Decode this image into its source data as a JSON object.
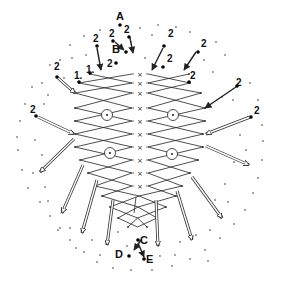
{
  "labels": {
    "A": {
      "text": "A",
      "x": 116,
      "y": 20
    },
    "B": {
      "text": "B",
      "x": 112,
      "y": 53
    },
    "C": {
      "text": "C",
      "x": 140,
      "y": 244
    },
    "D": {
      "text": "D",
      "x": 115,
      "y": 258
    },
    "E": {
      "text": "E",
      "x": 146,
      "y": 263
    }
  },
  "numbers": [
    {
      "text": "2",
      "x": 93,
      "y": 42
    },
    {
      "text": "2",
      "x": 109,
      "y": 37
    },
    {
      "text": "2",
      "x": 124,
      "y": 33
    },
    {
      "text": "2",
      "x": 107,
      "y": 67
    },
    {
      "text": "2",
      "x": 168,
      "y": 37
    },
    {
      "text": "2",
      "x": 201,
      "y": 47
    },
    {
      "text": "2",
      "x": 167,
      "y": 62
    },
    {
      "text": "2",
      "x": 190,
      "y": 79
    },
    {
      "text": "2",
      "x": 236,
      "y": 86
    },
    {
      "text": "2",
      "x": 254,
      "y": 114
    },
    {
      "text": "2",
      "x": 54,
      "y": 70
    },
    {
      "text": "2",
      "x": 30,
      "y": 113
    },
    {
      "text": "1.",
      "x": 86,
      "y": 73
    },
    {
      "text": "1.",
      "x": 74,
      "y": 79
    }
  ],
  "symbols": {
    "row_marker": "×",
    "circle_marker": "⊙"
  },
  "zigzag_rows": [
    {
      "y": 74,
      "lx": 90,
      "rx": 189,
      "x_marker": true
    },
    {
      "y": 83,
      "lx": 79,
      "rx": 190,
      "x_marker": true
    },
    {
      "y": 93,
      "lx": 75,
      "rx": 201,
      "x_marker": true
    },
    {
      "y": 108,
      "lx": 75,
      "rx": 205,
      "x_marker": true
    },
    {
      "y": 121,
      "lx": 75,
      "rx": 205,
      "x_marker": true
    },
    {
      "y": 134,
      "lx": 75,
      "rx": 203,
      "x_marker": true
    },
    {
      "y": 147,
      "lx": 75,
      "rx": 203,
      "x_marker": true
    },
    {
      "y": 160,
      "lx": 80,
      "rx": 198,
      "x_marker": true
    },
    {
      "y": 173,
      "lx": 88,
      "rx": 190,
      "x_marker": true
    },
    {
      "y": 186,
      "lx": 95,
      "rx": 182,
      "x_marker": true
    },
    {
      "y": 196,
      "lx": 102,
      "rx": 176,
      "x_marker": false
    },
    {
      "y": 207,
      "lx": 110,
      "rx": 166,
      "x_marker": false
    },
    {
      "y": 218,
      "lx": 118,
      "rx": 157,
      "x_marker": false
    },
    {
      "y": 227,
      "lx": 128,
      "rx": 147,
      "x_marker": false
    }
  ],
  "circles": [
    {
      "x": 107,
      "y": 115
    },
    {
      "x": 173,
      "y": 115
    },
    {
      "x": 110,
      "y": 153
    },
    {
      "x": 172,
      "y": 154
    }
  ],
  "arrows_solid": [
    {
      "x1": 97,
      "y1": 48,
      "x2": 101,
      "y2": 70
    },
    {
      "x1": 115,
      "y1": 42,
      "x2": 124,
      "y2": 50
    },
    {
      "x1": 130,
      "y1": 38,
      "x2": 133,
      "y2": 53
    },
    {
      "x1": 163,
      "y1": 48,
      "x2": 152,
      "y2": 70
    },
    {
      "x1": 196,
      "y1": 52,
      "x2": 184,
      "y2": 70
    },
    {
      "x1": 236,
      "y1": 87,
      "x2": 205,
      "y2": 108
    },
    {
      "x1": 141,
      "y1": 240,
      "x2": 134,
      "y2": 250
    },
    {
      "x1": 138,
      "y1": 243,
      "x2": 144,
      "y2": 257
    }
  ],
  "arrows_hollow": [
    {
      "x1": 58,
      "y1": 78,
      "x2": 75,
      "y2": 93
    },
    {
      "x1": 38,
      "y1": 117,
      "x2": 74,
      "y2": 134
    },
    {
      "x1": 250,
      "y1": 117,
      "x2": 206,
      "y2": 134
    },
    {
      "x1": 206,
      "y1": 146,
      "x2": 249,
      "y2": 165
    },
    {
      "x1": 74,
      "y1": 139,
      "x2": 40,
      "y2": 172
    },
    {
      "x1": 83,
      "y1": 165,
      "x2": 62,
      "y2": 213
    },
    {
      "x1": 97,
      "y1": 180,
      "x2": 82,
      "y2": 233
    },
    {
      "x1": 113,
      "y1": 200,
      "x2": 107,
      "y2": 245
    },
    {
      "x1": 156,
      "y1": 200,
      "x2": 158,
      "y2": 246
    },
    {
      "x1": 177,
      "y1": 191,
      "x2": 192,
      "y2": 240
    },
    {
      "x1": 192,
      "y1": 177,
      "x2": 222,
      "y2": 218
    }
  ],
  "big_dots": [
    {
      "x": 120,
      "y": 25
    },
    {
      "x": 97,
      "y": 46
    },
    {
      "x": 113,
      "y": 41
    },
    {
      "x": 129,
      "y": 37
    },
    {
      "x": 126,
      "y": 52
    },
    {
      "x": 116,
      "y": 63
    },
    {
      "x": 90,
      "y": 73
    },
    {
      "x": 79,
      "y": 82
    },
    {
      "x": 164,
      "y": 46
    },
    {
      "x": 198,
      "y": 52
    },
    {
      "x": 163,
      "y": 67
    },
    {
      "x": 189,
      "y": 82
    },
    {
      "x": 237,
      "y": 86
    },
    {
      "x": 251,
      "y": 117
    },
    {
      "x": 57,
      "y": 77
    },
    {
      "x": 36,
      "y": 116
    },
    {
      "x": 138,
      "y": 240
    },
    {
      "x": 129,
      "y": 256
    },
    {
      "x": 144,
      "y": 259
    }
  ],
  "small_dots": [
    {
      "x": 140,
      "y": 28
    },
    {
      "x": 158,
      "y": 25
    },
    {
      "x": 176,
      "y": 27
    },
    {
      "x": 190,
      "y": 32
    },
    {
      "x": 100,
      "y": 30
    },
    {
      "x": 84,
      "y": 36
    },
    {
      "x": 70,
      "y": 45
    },
    {
      "x": 86,
      "y": 55
    },
    {
      "x": 72,
      "y": 58
    },
    {
      "x": 60,
      "y": 60
    },
    {
      "x": 50,
      "y": 65
    },
    {
      "x": 42,
      "y": 83
    },
    {
      "x": 32,
      "y": 87
    },
    {
      "x": 25,
      "y": 104
    },
    {
      "x": 20,
      "y": 121
    },
    {
      "x": 17,
      "y": 137
    },
    {
      "x": 18,
      "y": 150
    },
    {
      "x": 22,
      "y": 170
    },
    {
      "x": 28,
      "y": 188
    },
    {
      "x": 40,
      "y": 202
    },
    {
      "x": 50,
      "y": 216
    },
    {
      "x": 60,
      "y": 228
    },
    {
      "x": 70,
      "y": 240
    },
    {
      "x": 84,
      "y": 252
    },
    {
      "x": 97,
      "y": 262
    },
    {
      "x": 113,
      "y": 268
    },
    {
      "x": 131,
      "y": 270
    },
    {
      "x": 152,
      "y": 270
    },
    {
      "x": 172,
      "y": 266
    },
    {
      "x": 190,
      "y": 259
    },
    {
      "x": 205,
      "y": 250
    },
    {
      "x": 220,
      "y": 238
    },
    {
      "x": 234,
      "y": 224
    },
    {
      "x": 245,
      "y": 210
    },
    {
      "x": 253,
      "y": 193
    },
    {
      "x": 258,
      "y": 178
    },
    {
      "x": 262,
      "y": 160
    },
    {
      "x": 263,
      "y": 141
    },
    {
      "x": 262,
      "y": 125
    },
    {
      "x": 258,
      "y": 100
    },
    {
      "x": 250,
      "y": 83
    },
    {
      "x": 225,
      "y": 55
    },
    {
      "x": 216,
      "y": 42
    },
    {
      "x": 204,
      "y": 60
    },
    {
      "x": 213,
      "y": 72
    },
    {
      "x": 222,
      "y": 97
    },
    {
      "x": 233,
      "y": 100
    },
    {
      "x": 240,
      "y": 135
    },
    {
      "x": 246,
      "y": 150
    },
    {
      "x": 234,
      "y": 162
    },
    {
      "x": 225,
      "y": 184
    },
    {
      "x": 215,
      "y": 200
    },
    {
      "x": 228,
      "y": 202
    },
    {
      "x": 210,
      "y": 230
    },
    {
      "x": 196,
      "y": 235
    },
    {
      "x": 44,
      "y": 104
    },
    {
      "x": 35,
      "y": 140
    },
    {
      "x": 42,
      "y": 155
    },
    {
      "x": 33,
      "y": 173
    },
    {
      "x": 45,
      "y": 187
    },
    {
      "x": 48,
      "y": 201
    },
    {
      "x": 58,
      "y": 230
    },
    {
      "x": 70,
      "y": 228
    },
    {
      "x": 76,
      "y": 248
    },
    {
      "x": 92,
      "y": 240
    },
    {
      "x": 100,
      "y": 255
    },
    {
      "x": 118,
      "y": 232
    },
    {
      "x": 127,
      "y": 246
    },
    {
      "x": 160,
      "y": 256
    },
    {
      "x": 175,
      "y": 255
    },
    {
      "x": 180,
      "y": 242
    },
    {
      "x": 208,
      "y": 261
    },
    {
      "x": 64,
      "y": 78
    },
    {
      "x": 48,
      "y": 95
    },
    {
      "x": 152,
      "y": 35
    },
    {
      "x": 145,
      "y": 58
    }
  ]
}
